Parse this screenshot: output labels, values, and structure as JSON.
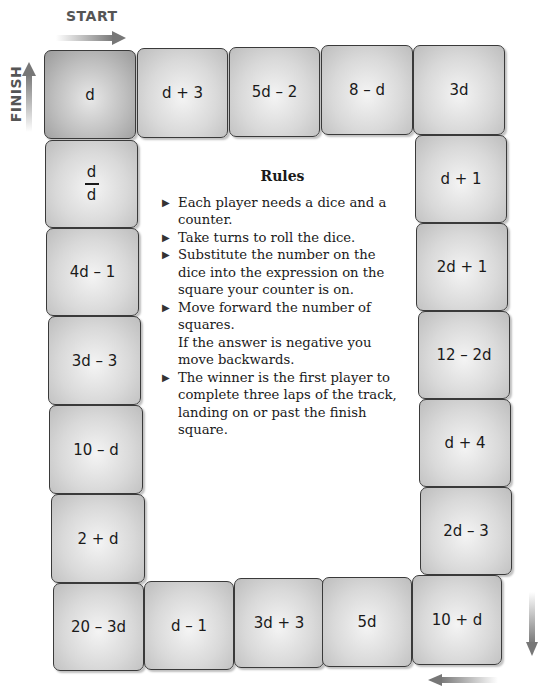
{
  "labels": {
    "start": "START",
    "finish": "FINISH"
  },
  "track": {
    "top": [
      {
        "text": "d",
        "finish": true
      },
      {
        "text": "d + 3"
      },
      {
        "text": "5d – 2"
      },
      {
        "text": "8 – d"
      },
      {
        "text": "3d"
      }
    ],
    "right": [
      {
        "text": "d + 1"
      },
      {
        "text": "2d + 1"
      },
      {
        "text": "12 – 2d"
      },
      {
        "text": "d + 4"
      },
      {
        "text": "2d – 3"
      }
    ],
    "bottom": [
      {
        "text": "20 – 3d"
      },
      {
        "text": "d – 1"
      },
      {
        "text": "3d + 3"
      },
      {
        "text": "5d"
      },
      {
        "text": "10 + d"
      }
    ],
    "left": [
      {
        "numerator": "d",
        "denominator": "d"
      },
      {
        "text": "4d – 1"
      },
      {
        "text": "3d – 3"
      },
      {
        "text": "10 – d"
      },
      {
        "text": "2 + d"
      }
    ]
  },
  "rules": {
    "title": "Rules",
    "items": [
      {
        "text": "Each player needs a dice and a counter."
      },
      {
        "text": "Take turns to roll the dice."
      },
      {
        "text": "Substitute the number on the dice into the expression on the square your counter is on."
      },
      {
        "text": "Move forward the number of squares.",
        "note": "If the answer is negative you move backwards."
      },
      {
        "text": "The winner is the first player to complete three laps of the track, landing on or past the finish square."
      }
    ]
  },
  "icons": {
    "bullet": "▶"
  }
}
